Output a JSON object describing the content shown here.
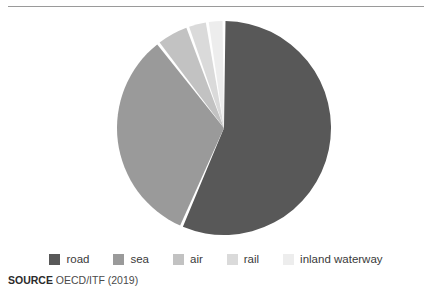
{
  "figure": {
    "has_top_rule": true,
    "background": "#ffffff"
  },
  "legend": {
    "items": [
      {
        "label": "road",
        "color": "#585858"
      },
      {
        "label": "sea",
        "color": "#9a9a9a"
      },
      {
        "label": "air",
        "color": "#c2c2c2"
      },
      {
        "label": "rail",
        "color": "#dadada"
      },
      {
        "label": "inland waterway",
        "color": "#ededed"
      }
    ]
  },
  "source": {
    "keyword": "SOURCE",
    "text": "OECD/ITF (2019)"
  },
  "chart_data": {
    "type": "pie",
    "title": "",
    "subtitle": "",
    "xlabel": "",
    "ylabel": "",
    "start_angle_deg": 0,
    "direction": "clockwise",
    "center": {
      "x": 224,
      "y": 118
    },
    "radius": 107,
    "slice_gap_deg": 1.6,
    "categories": [
      "road",
      "sea",
      "air",
      "rail",
      "inland waterway"
    ],
    "values": [
      56.5,
      33.0,
      5.0,
      3.0,
      2.5
    ],
    "colors": [
      "#585858",
      "#9a9a9a",
      "#c2c2c2",
      "#dadada",
      "#ededed"
    ],
    "legend_position": "bottom",
    "grid": false,
    "data_labels": false,
    "annotations": []
  }
}
